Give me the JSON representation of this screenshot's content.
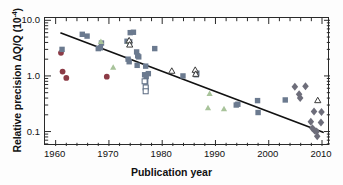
{
  "chart_data": {
    "type": "scatter",
    "title": "",
    "xlabel": "Publication year",
    "ylabel": "Relative precision ΔQ/Q (10",
    "ylabel_exponent": "-4",
    "ylabel_close": ")",
    "xlim": [
      1958,
      2011.5
    ],
    "ylim": [
      0.055,
      11.0
    ],
    "yscale": "log",
    "xscale": "linear",
    "grid": false,
    "legend": "none",
    "xticks": [
      1960,
      1970,
      1980,
      1990,
      2000,
      2010
    ],
    "xtick_labels": [
      "1960",
      "1970",
      "1980",
      "1990",
      "2000",
      "2010"
    ],
    "yticks": [
      10.0,
      1.0,
      0.1
    ],
    "ytick_labels": [
      "10.0",
      "1.0",
      "0.1"
    ],
    "colors": {
      "circle": "#8c3b46",
      "square": "#6b7a8f",
      "triangle_filled": "#a8c39a",
      "triangle_open_edge": "#3a3a3a",
      "triangle_open_fill": "#ffffff",
      "diamond": "#6d6d7a",
      "square_open_edge": "#5a6a80",
      "square_open_fill": "#ffffff",
      "trendline": "#111111",
      "axis": "#2a2a2a"
    },
    "series": [
      {
        "name": "circles",
        "marker": "circle",
        "color": "#8c3b46",
        "points": [
          {
            "x": 1961.0,
            "y": 2.6
          },
          {
            "x": 1961.3,
            "y": 1.2
          },
          {
            "x": 1962.0,
            "y": 0.92
          },
          {
            "x": 1969.6,
            "y": 0.97
          }
        ]
      },
      {
        "name": "squares-filled",
        "marker": "square",
        "color": "#6b7a8f",
        "points": [
          {
            "x": 1961.2,
            "y": 3.0
          },
          {
            "x": 1965.0,
            "y": 5.6
          },
          {
            "x": 1965.9,
            "y": 5.2
          },
          {
            "x": 1968.0,
            "y": 3.1
          },
          {
            "x": 1968.4,
            "y": 3.2
          },
          {
            "x": 1968.6,
            "y": 3.9
          },
          {
            "x": 1973.4,
            "y": 4.2
          },
          {
            "x": 1973.9,
            "y": 4.1
          },
          {
            "x": 1974.0,
            "y": 6.0
          },
          {
            "x": 1974.6,
            "y": 6.1
          },
          {
            "x": 1973.6,
            "y": 2.0
          },
          {
            "x": 1973.8,
            "y": 1.8
          },
          {
            "x": 1975.2,
            "y": 2.7
          },
          {
            "x": 1975.4,
            "y": 2.3
          },
          {
            "x": 1975.6,
            "y": 2.2
          },
          {
            "x": 1975.3,
            "y": 1.55
          },
          {
            "x": 1976.9,
            "y": 1.5
          },
          {
            "x": 1978.6,
            "y": 3.1
          },
          {
            "x": 1976.7,
            "y": 1.05
          },
          {
            "x": 1977.4,
            "y": 1.1
          },
          {
            "x": 1977.0,
            "y": 0.98
          },
          {
            "x": 1976.9,
            "y": 0.8
          },
          {
            "x": 1976.9,
            "y": 0.63
          },
          {
            "x": 1983.9,
            "y": 1.0
          },
          {
            "x": 1986.4,
            "y": 1.05
          },
          {
            "x": 1986.5,
            "y": 1.12
          },
          {
            "x": 1993.9,
            "y": 0.3
          },
          {
            "x": 1994.2,
            "y": 0.31
          },
          {
            "x": 1997.9,
            "y": 0.36
          },
          {
            "x": 1998.0,
            "y": 0.22
          },
          {
            "x": 2003.1,
            "y": 0.37
          }
        ]
      },
      {
        "name": "squares-open",
        "marker": "square-open",
        "color": "#5a6a80",
        "points": [
          {
            "x": 1976.9,
            "y": 0.62
          },
          {
            "x": 1976.9,
            "y": 0.53
          },
          {
            "x": 1976.7,
            "y": 0.8
          }
        ]
      },
      {
        "name": "triangles-filled",
        "marker": "triangle",
        "color": "#a8c39a",
        "points": [
          {
            "x": 1968.5,
            "y": 4.2
          },
          {
            "x": 1970.8,
            "y": 1.45
          },
          {
            "x": 1973.7,
            "y": 4.3
          },
          {
            "x": 1988.9,
            "y": 0.49
          },
          {
            "x": 1988.6,
            "y": 0.27
          },
          {
            "x": 1991.6,
            "y": 0.26
          }
        ]
      },
      {
        "name": "triangles-open",
        "marker": "triangle-open",
        "color": "#3a3a3a",
        "points": [
          {
            "x": 1973.8,
            "y": 4.4
          },
          {
            "x": 1973.9,
            "y": 3.7
          },
          {
            "x": 1981.8,
            "y": 1.25
          },
          {
            "x": 1986.2,
            "y": 1.3
          },
          {
            "x": 1986.3,
            "y": 1.1
          },
          {
            "x": 2009.2,
            "y": 0.37
          }
        ]
      },
      {
        "name": "diamonds",
        "marker": "diamond",
        "color": "#6d6d7a",
        "points": [
          {
            "x": 2004.9,
            "y": 0.64
          },
          {
            "x": 2005.7,
            "y": 0.47
          },
          {
            "x": 2005.9,
            "y": 0.4
          },
          {
            "x": 2006.9,
            "y": 0.65
          },
          {
            "x": 2008.5,
            "y": 0.23
          },
          {
            "x": 2007.9,
            "y": 0.15
          },
          {
            "x": 2008.2,
            "y": 0.115
          },
          {
            "x": 2008.6,
            "y": 0.105
          },
          {
            "x": 2009.0,
            "y": 0.1
          },
          {
            "x": 2009.1,
            "y": 0.082
          },
          {
            "x": 2009.8,
            "y": 0.145
          },
          {
            "x": 2009.9,
            "y": 0.225
          }
        ]
      }
    ],
    "trendline": {
      "name": "fit-line",
      "x0": 1961.0,
      "y0": 5.9,
      "x1": 2010.2,
      "y1": 0.097
    }
  }
}
